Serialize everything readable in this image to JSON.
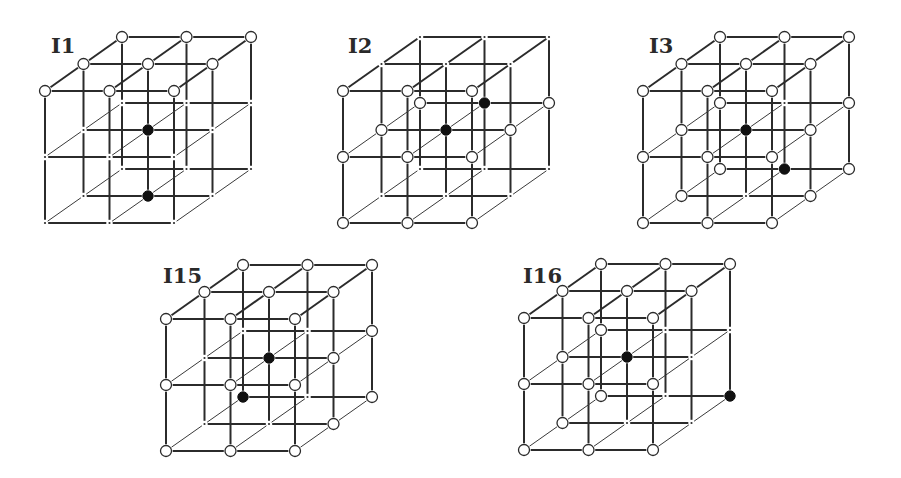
{
  "figure": {
    "title": "",
    "legend": {
      "o": "open circle (white node)",
      "f": "filled circle (black node)",
      "d": "lattice point (small dot)"
    },
    "lattice": {
      "size": 3,
      "x_step": [
        64.5,
        0
      ],
      "y_step": [
        0,
        66
      ],
      "depth_step": [
        38.5,
        -27
      ],
      "node_order": "index = level*9 + depth*3 + column; level top->bottom, depth front->back, column left->right",
      "open_radius": 5.5,
      "filled_radius": 5.2,
      "dot_radius": 1.1
    },
    "cubes": [
      {
        "label": "I1",
        "origin": [
          45,
          91
        ],
        "label_pos": [
          51,
          53
        ],
        "nodes": [
          "o",
          "o",
          "o",
          "o",
          "o",
          "o",
          "o",
          "o",
          "o",
          "d",
          "d",
          "d",
          "d",
          "f",
          "d",
          "d",
          "d",
          "d",
          "d",
          "d",
          "d",
          "d",
          "f",
          "d",
          "d",
          "d",
          "d"
        ]
      },
      {
        "label": "I2",
        "origin": [
          343,
          91
        ],
        "label_pos": [
          348,
          53
        ],
        "nodes": [
          "o",
          "o",
          "o",
          "d",
          "d",
          "d",
          "d",
          "d",
          "d",
          "o",
          "o",
          "o",
          "o",
          "f",
          "o",
          "o",
          "f",
          "o",
          "o",
          "o",
          "o",
          "d",
          "d",
          "d",
          "d",
          "d",
          "d"
        ]
      },
      {
        "label": "I3",
        "origin": [
          643,
          91
        ],
        "label_pos": [
          649,
          53
        ],
        "nodes": [
          "o",
          "o",
          "o",
          "o",
          "o",
          "o",
          "o",
          "o",
          "o",
          "o",
          "o",
          "o",
          "o",
          "f",
          "o",
          "o",
          "d",
          "o",
          "o",
          "o",
          "o",
          "o",
          "d",
          "o",
          "o",
          "f",
          "o"
        ]
      },
      {
        "label": "I15",
        "origin": [
          166,
          319
        ],
        "label_pos": [
          163,
          283
        ],
        "nodes": [
          "o",
          "o",
          "o",
          "o",
          "o",
          "o",
          "o",
          "o",
          "o",
          "o",
          "o",
          "o",
          "d",
          "f",
          "o",
          "d",
          "d",
          "o",
          "o",
          "o",
          "o",
          "d",
          "d",
          "o",
          "f",
          "d",
          "o"
        ]
      },
      {
        "label": "I16",
        "origin": [
          524,
          318
        ],
        "label_pos": [
          523,
          283
        ],
        "nodes": [
          "o",
          "o",
          "o",
          "o",
          "o",
          "o",
          "o",
          "o",
          "o",
          "o",
          "o",
          "o",
          "o",
          "f",
          "d",
          "o",
          "d",
          "d",
          "o",
          "o",
          "o",
          "o",
          "d",
          "d",
          "o",
          "d",
          "f"
        ]
      }
    ]
  }
}
